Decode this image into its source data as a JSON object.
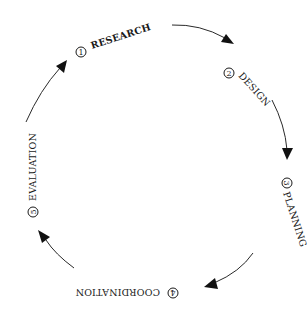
{
  "diagram": {
    "type": "cycle",
    "direction": "clockwise",
    "colors": {
      "ink": "#1a1a1a",
      "background": "#ffffff"
    },
    "steps": [
      {
        "number": "1",
        "label": "RESEARCH"
      },
      {
        "number": "2",
        "label": "DESIGN"
      },
      {
        "number": "3",
        "label": "PLANNING"
      },
      {
        "number": "4",
        "label": "COORDINATION"
      },
      {
        "number": "5",
        "label": "EVALUATION"
      }
    ],
    "connectors": [
      {
        "from": "1",
        "to": "2"
      },
      {
        "from": "2",
        "to": "3"
      },
      {
        "from": "3",
        "to": "4"
      },
      {
        "from": "4",
        "to": "5"
      },
      {
        "from": "5",
        "to": "1"
      }
    ]
  }
}
